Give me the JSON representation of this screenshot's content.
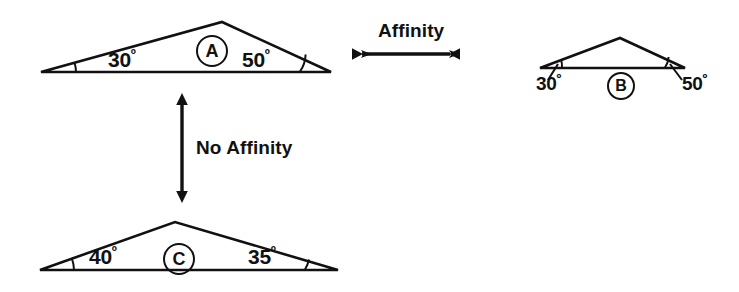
{
  "figure": {
    "background_color": "#ffffff",
    "ink_color": "#111111"
  },
  "relations": [
    {
      "id": "affinity",
      "label": "Affinity",
      "orientation": "horizontal",
      "arrow": "double-headed",
      "connects": [
        "A",
        "B"
      ]
    },
    {
      "id": "no-affinity",
      "label": "No Affinity",
      "orientation": "vertical",
      "arrow": "double-headed",
      "connects": [
        "A",
        "C"
      ]
    }
  ],
  "triangles": [
    {
      "id": "A",
      "letter": "A",
      "size": "large",
      "angles": {
        "left": "30",
        "right": "50",
        "degree_symbol": "º"
      },
      "labels_position": "inside"
    },
    {
      "id": "B",
      "letter": "B",
      "size": "small",
      "angles": {
        "left": "30",
        "right": "50",
        "degree_symbol": "º"
      },
      "labels_position": "below"
    },
    {
      "id": "C",
      "letter": "C",
      "size": "large",
      "angles": {
        "left": "40",
        "right": "35",
        "degree_symbol": "º"
      },
      "labels_position": "inside"
    }
  ]
}
